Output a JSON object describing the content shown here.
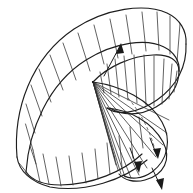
{
  "figure": {
    "type": "line-drawing",
    "background_color": "#ffffff",
    "stroke_color": "#2b2b2b",
    "hidden_stroke_color": "#555555",
    "canvas": {
      "width": 193,
      "height": 193
    },
    "caption": "",
    "labels": []
  },
  "geometry": {
    "cuspidal_point": {
      "x": 93,
      "y": 82
    },
    "outer_band": {
      "name": "upper-outer-edge",
      "path": "M 18,156 C 14,108 34,56 78,28 C 110,8 146,4 168,14 C 180,20 186,30 185,42",
      "inner_path": "M 26,172 C 30,130 50,86 88,62 C 116,44 146,40 164,48 C 174,53 179,61 178,70"
    },
    "lower_band": {
      "name": "lower-outer-edge",
      "path": "M 18,156 C 22,170 34,182 52,186 C 86,192 124,180 146,162",
      "inner_path": "M 26,172 C 34,178 46,182 60,182 C 92,182 122,170 140,156"
    },
    "right_curl": {
      "name": "right-ellipse-curl",
      "outer": "M 185,42 C 186,62 176,82 156,96 C 136,110 118,114 108,108",
      "inner": "M 178,70 C 178,84 170,96 156,104"
    },
    "lower_right_lobe": {
      "name": "lower-right-lobe",
      "path": "M 93,82 C 126,88 156,104 166,126 C 174,146 162,166 140,174 C 128,178 118,176 114,170"
    },
    "hidden_edge": {
      "name": "hidden-dashed-edge",
      "path": "M 120,92 C 134,106 146,124 152,146"
    },
    "ruling_counts": {
      "upper_band_rulings": 14,
      "lower_band_rulings": 13,
      "right_curl_rulings": 11,
      "fan_rulings": 12
    }
  },
  "annotations": {
    "arrows": [
      {
        "name": "tangent-arrow-upper",
        "from": {
          "x": 105,
          "y": 74
        },
        "to": {
          "x": 121,
          "y": 44
        },
        "direction": "up-right"
      },
      {
        "name": "tangent-arrow-lower-inner",
        "from": {
          "x": 152,
          "y": 142
        },
        "to": {
          "x": 160,
          "y": 158
        },
        "direction": "down-right"
      },
      {
        "name": "tangent-arrow-lower-left",
        "from": {
          "x": 132,
          "y": 150
        },
        "to": {
          "x": 140,
          "y": 172
        },
        "direction": "down"
      },
      {
        "name": "tangent-arrow-bottom",
        "from": {
          "x": 154,
          "y": 166
        },
        "to": {
          "x": 162,
          "y": 188
        },
        "direction": "down-right"
      }
    ]
  },
  "rulings": {
    "upper": [
      {
        "x1": 30,
        "y1": 146,
        "x2": 36,
        "y2": 164
      },
      {
        "x1": 27,
        "y1": 126,
        "x2": 34,
        "y2": 150
      },
      {
        "x1": 28,
        "y1": 106,
        "x2": 36,
        "y2": 134
      },
      {
        "x1": 33,
        "y1": 88,
        "x2": 42,
        "y2": 118
      },
      {
        "x1": 41,
        "y1": 72,
        "x2": 52,
        "y2": 104
      },
      {
        "x1": 52,
        "y1": 57,
        "x2": 64,
        "y2": 92
      },
      {
        "x1": 65,
        "y1": 45,
        "x2": 77,
        "y2": 82
      },
      {
        "x1": 80,
        "y1": 35,
        "x2": 92,
        "y2": 72
      },
      {
        "x1": 96,
        "y1": 27,
        "x2": 106,
        "y2": 64
      },
      {
        "x1": 112,
        "y1": 21,
        "x2": 120,
        "y2": 58
      },
      {
        "x1": 128,
        "y1": 16,
        "x2": 134,
        "y2": 53
      },
      {
        "x1": 144,
        "y1": 13,
        "x2": 148,
        "y2": 50
      },
      {
        "x1": 158,
        "y1": 13,
        "x2": 160,
        "y2": 50
      },
      {
        "x1": 172,
        "y1": 18,
        "x2": 171,
        "y2": 55
      }
    ],
    "lower": [
      {
        "x1": 20,
        "y1": 158,
        "x2": 27,
        "y2": 172
      },
      {
        "x1": 22,
        "y1": 164,
        "x2": 32,
        "y2": 178
      },
      {
        "x1": 30,
        "y1": 146,
        "x2": 38,
        "y2": 172
      },
      {
        "x1": 40,
        "y1": 152,
        "x2": 47,
        "y2": 180
      },
      {
        "x1": 54,
        "y1": 155,
        "x2": 60,
        "y2": 182
      },
      {
        "x1": 68,
        "y1": 155,
        "x2": 73,
        "y2": 182
      },
      {
        "x1": 82,
        "y1": 152,
        "x2": 86,
        "y2": 180
      },
      {
        "x1": 96,
        "y1": 148,
        "x2": 99,
        "y2": 176
      },
      {
        "x1": 109,
        "y1": 142,
        "x2": 112,
        "y2": 170
      },
      {
        "x1": 121,
        "y1": 134,
        "x2": 124,
        "y2": 162
      },
      {
        "x1": 132,
        "y1": 124,
        "x2": 136,
        "y2": 152
      },
      {
        "x1": 141,
        "y1": 114,
        "x2": 145,
        "y2": 142
      }
    ],
    "curl": [
      {
        "x1": 100,
        "y1": 70,
        "x2": 106,
        "y2": 92
      },
      {
        "x1": 108,
        "y1": 62,
        "x2": 113,
        "y2": 92
      },
      {
        "x1": 117,
        "y1": 56,
        "x2": 121,
        "y2": 94
      },
      {
        "x1": 127,
        "y1": 52,
        "x2": 130,
        "y2": 97
      },
      {
        "x1": 138,
        "y1": 49,
        "x2": 140,
        "y2": 100
      },
      {
        "x1": 149,
        "y1": 48,
        "x2": 150,
        "y2": 103
      },
      {
        "x1": 160,
        "y1": 50,
        "x2": 159,
        "y2": 103
      },
      {
        "x1": 170,
        "y1": 56,
        "x2": 167,
        "y2": 99
      },
      {
        "x1": 177,
        "y1": 66,
        "x2": 173,
        "y2": 92
      }
    ],
    "fan": [
      {
        "x2": 168,
        "y2": 122
      },
      {
        "x2": 166,
        "y2": 134
      },
      {
        "x2": 162,
        "y2": 146
      },
      {
        "x2": 156,
        "y2": 157
      },
      {
        "x2": 148,
        "y2": 166
      },
      {
        "x2": 140,
        "y2": 172
      },
      {
        "x2": 132,
        "y2": 174
      },
      {
        "x2": 126,
        "y2": 173
      },
      {
        "x2": 121,
        "y2": 170
      },
      {
        "x2": 118,
        "y2": 166
      },
      {
        "x2": 116,
        "y2": 161
      },
      {
        "x2": 115,
        "y2": 155
      }
    ]
  }
}
